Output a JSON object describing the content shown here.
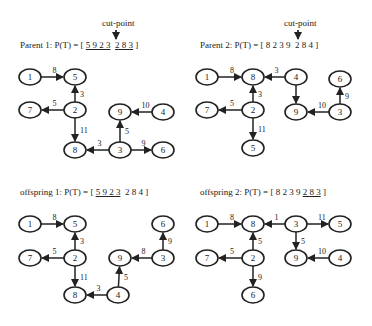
{
  "cut_label": "cut-point",
  "panels": [
    {
      "id": "parent1",
      "prefix": "Parent 1: P(T) = [ ",
      "seg1": "5 9 2 3",
      "seg2": "2 8 3",
      "suffix": " ]",
      "underline": [
        true,
        true
      ],
      "show_cut": true,
      "nodes": [
        {
          "id": "1",
          "x": 30,
          "y": 77
        },
        {
          "id": "5",
          "x": 75,
          "y": 77
        },
        {
          "id": "7",
          "x": 30,
          "y": 110
        },
        {
          "id": "2",
          "x": 75,
          "y": 110
        },
        {
          "id": "9",
          "x": 120,
          "y": 112
        },
        {
          "id": "4",
          "x": 163,
          "y": 112
        },
        {
          "id": "8",
          "x": 75,
          "y": 150
        },
        {
          "id": "3",
          "x": 120,
          "y": 150
        },
        {
          "id": "6",
          "x": 163,
          "y": 150
        }
      ],
      "edges": [
        {
          "from": "1",
          "to": "5",
          "w": "8"
        },
        {
          "from": "2",
          "to": "5",
          "w": "3"
        },
        {
          "from": "2",
          "to": "7",
          "w": "5"
        },
        {
          "from": "2",
          "to": "8",
          "w": "11"
        },
        {
          "from": "4",
          "to": "9",
          "w": "10"
        },
        {
          "from": "3",
          "to": "9",
          "w": "5"
        },
        {
          "from": "3",
          "to": "8",
          "w": "3"
        },
        {
          "from": "3",
          "to": "6",
          "w": "9"
        }
      ]
    },
    {
      "id": "parent2",
      "prefix": "Parent 2: P(T) = [ ",
      "seg1": "8 2 3 9",
      "seg2": "2 8 4",
      "suffix": " ]",
      "underline": [
        false,
        false
      ],
      "show_cut": true,
      "nodes": [
        {
          "id": "1",
          "x": 207,
          "y": 77
        },
        {
          "id": "8",
          "x": 253,
          "y": 77
        },
        {
          "id": "4",
          "x": 296,
          "y": 77
        },
        {
          "id": "6",
          "x": 340,
          "y": 79
        },
        {
          "id": "7",
          "x": 207,
          "y": 110
        },
        {
          "id": "2",
          "x": 253,
          "y": 110
        },
        {
          "id": "9",
          "x": 296,
          "y": 112
        },
        {
          "id": "3",
          "x": 340,
          "y": 112
        },
        {
          "id": "5",
          "x": 253,
          "y": 148
        }
      ],
      "edges": [
        {
          "from": "1",
          "to": "8",
          "w": "8"
        },
        {
          "from": "4",
          "to": "8",
          "w": "3"
        },
        {
          "from": "2",
          "to": "8",
          "w": "3"
        },
        {
          "from": "2",
          "to": "7",
          "w": "5"
        },
        {
          "from": "2",
          "to": "5",
          "w": "11"
        },
        {
          "from": "4",
          "to": "9",
          "w": ""
        },
        {
          "from": "3",
          "to": "9",
          "w": "10"
        },
        {
          "from": "3",
          "to": "6",
          "w": "9"
        }
      ]
    },
    {
      "id": "offspring1",
      "prefix": "offspring 1: P(T) = [ ",
      "seg1": "5 9 2 3",
      "seg2": "2 8 4",
      "suffix": " ]",
      "underline": [
        true,
        false
      ],
      "show_cut": false,
      "nodes": [
        {
          "id": "1",
          "x": 30,
          "y": 224
        },
        {
          "id": "5",
          "x": 75,
          "y": 224
        },
        {
          "id": "6",
          "x": 163,
          "y": 224
        },
        {
          "id": "7",
          "x": 30,
          "y": 258
        },
        {
          "id": "2",
          "x": 75,
          "y": 258
        },
        {
          "id": "9",
          "x": 120,
          "y": 258
        },
        {
          "id": "3",
          "x": 163,
          "y": 258
        },
        {
          "id": "8",
          "x": 75,
          "y": 295
        },
        {
          "id": "4",
          "x": 118,
          "y": 295
        }
      ],
      "edges": [
        {
          "from": "1",
          "to": "5",
          "w": "8"
        },
        {
          "from": "2",
          "to": "5",
          "w": "3"
        },
        {
          "from": "2",
          "to": "7",
          "w": "5"
        },
        {
          "from": "2",
          "to": "8",
          "w": "11"
        },
        {
          "from": "3",
          "to": "9",
          "w": "8"
        },
        {
          "from": "3",
          "to": "6",
          "w": "9"
        },
        {
          "from": "4",
          "to": "9",
          "w": "5"
        },
        {
          "from": "4",
          "to": "8",
          "w": "3"
        }
      ]
    },
    {
      "id": "offspring2",
      "prefix": "offspring 2: P(T) = [ ",
      "seg1": "8 2 3 9",
      "seg2": "2 8 3",
      "suffix": " ]",
      "underline": [
        false,
        true
      ],
      "show_cut": false,
      "nodes": [
        {
          "id": "1",
          "x": 207,
          "y": 224
        },
        {
          "id": "8",
          "x": 253,
          "y": 224
        },
        {
          "id": "3",
          "x": 296,
          "y": 224
        },
        {
          "id": "5",
          "x": 340,
          "y": 224
        },
        {
          "id": "7",
          "x": 207,
          "y": 258
        },
        {
          "id": "2",
          "x": 253,
          "y": 258
        },
        {
          "id": "9",
          "x": 296,
          "y": 258
        },
        {
          "id": "4",
          "x": 340,
          "y": 258
        },
        {
          "id": "6",
          "x": 253,
          "y": 295
        }
      ],
      "edges": [
        {
          "from": "1",
          "to": "8",
          "w": "8"
        },
        {
          "from": "3",
          "to": "8",
          "w": "1"
        },
        {
          "from": "3",
          "to": "5",
          "w": "11"
        },
        {
          "from": "3",
          "to": "9",
          "w": "5"
        },
        {
          "from": "2",
          "to": "8",
          "w": "5"
        },
        {
          "from": "2",
          "to": "7",
          "w": "5"
        },
        {
          "from": "2",
          "to": "6",
          "w": "9"
        },
        {
          "from": "4",
          "to": "9",
          "w": "10"
        }
      ]
    }
  ]
}
